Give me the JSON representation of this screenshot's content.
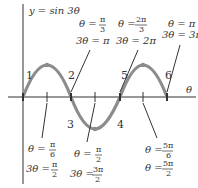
{
  "diagram": {
    "title": "y = sin 3θ",
    "axis_label": "θ",
    "curve_color": "#8c8c8c",
    "axis_color": "#333333",
    "segment_numbers": [
      "1",
      "2",
      "3",
      "4",
      "5",
      "6"
    ],
    "annotations": [
      {
        "id": "a1",
        "theta": "θ =",
        "theta_num": "π",
        "theta_den": "6",
        "three_theta": "3θ =",
        "three_num": "π",
        "three_den": "2"
      },
      {
        "id": "a2",
        "theta": "θ =",
        "theta_num": "π",
        "theta_den": "3",
        "three_theta": "3θ = π"
      },
      {
        "id": "a3",
        "theta": "θ =",
        "theta_num": "π",
        "theta_den": "2",
        "three_theta": "3θ =",
        "three_num": "3π",
        "three_den": "2"
      },
      {
        "id": "a4",
        "theta": "θ =",
        "theta_num": "2π",
        "theta_den": "3",
        "three_theta": "3θ = 2π"
      },
      {
        "id": "a5",
        "theta": "θ =",
        "theta_num": "5π",
        "theta_den": "6",
        "three_theta": "θ =",
        "three_num": "5π",
        "three_den": "2"
      },
      {
        "id": "a6",
        "theta": "θ = π",
        "three_theta": "3θ = 3π"
      }
    ]
  }
}
